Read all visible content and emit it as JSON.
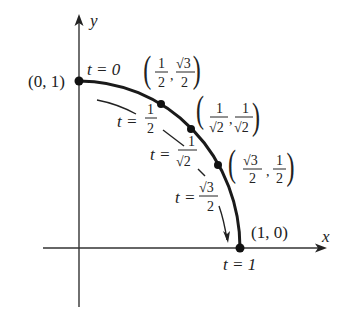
{
  "axes": {
    "x_label": "x",
    "y_label": "y"
  },
  "points": [
    {
      "coord": "(0, 1)",
      "t_label": "t = 0"
    },
    {
      "coord_x_num": "1",
      "coord_x_den": "2",
      "coord_y_num": "√3",
      "coord_y_den": "2"
    },
    {
      "coord_x_num": "1",
      "coord_x_den": "√2",
      "coord_y_num": "1",
      "coord_y_den": "√2"
    },
    {
      "coord_x_num": "√3",
      "coord_x_den": "2",
      "coord_y_num": "1",
      "coord_y_den": "2"
    },
    {
      "coord": "(1, 0)",
      "t_label": "t = 1"
    }
  ],
  "t_labels": [
    {
      "prefix": "t =",
      "num": "1",
      "den": "2"
    },
    {
      "prefix": "t =",
      "num": "1",
      "den": "√2"
    },
    {
      "prefix": "t =",
      "num": "√3",
      "den": "2"
    }
  ],
  "colors": {
    "curve": "#1a1a1a",
    "axis": "#333333",
    "text": "#222222"
  }
}
